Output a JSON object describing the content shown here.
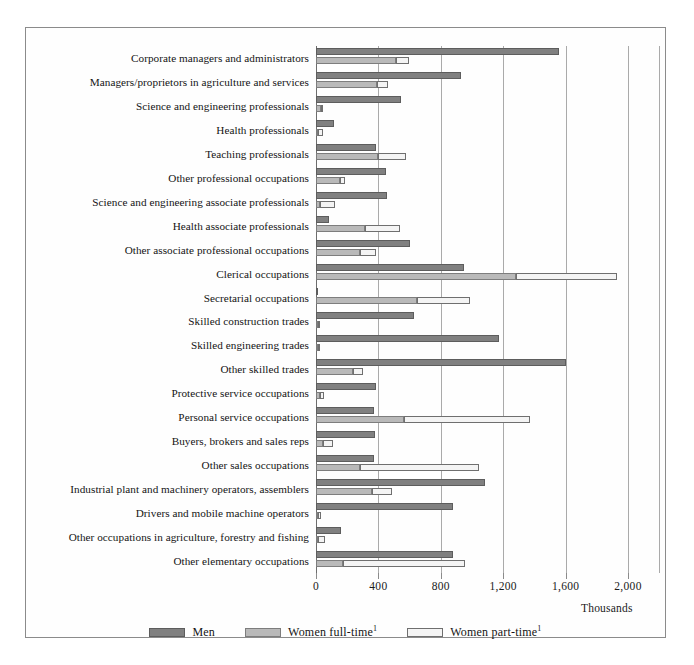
{
  "chart_data": {
    "type": "bar",
    "orientation": "horizontal",
    "style": "grouped-stacked",
    "title": "",
    "xlabel": "Thousands",
    "ylabel": "",
    "xlim": [
      0,
      2200
    ],
    "ticks": [
      0,
      400,
      800,
      1200,
      1600,
      2000
    ],
    "tick_labels": [
      "0",
      "400",
      "800",
      "1,200",
      "1,600",
      "2,000"
    ],
    "grid": "vertical",
    "legend_position": "bottom-center",
    "legend": [
      "Men",
      "Women full-time",
      "Women part-time"
    ],
    "legend_footnote_marker": "1",
    "series": [
      {
        "name": "Men",
        "color": "#808080",
        "values": [
          1560,
          930,
          545,
          115,
          385,
          450,
          455,
          85,
          605,
          950,
          15,
          625,
          1170,
          1605,
          385,
          370,
          380,
          370,
          1085,
          880,
          160,
          880
        ]
      },
      {
        "name": "Women full-time",
        "color": "#b9b9b9",
        "values": [
          515,
          390,
          30,
          15,
          400,
          155,
          25,
          315,
          285,
          1285,
          650,
          15,
          15,
          240,
          25,
          565,
          45,
          285,
          360,
          15,
          15,
          170
        ]
      },
      {
        "name": "Women part-time",
        "color": "#f4f4f4",
        "values": [
          80,
          70,
          15,
          30,
          180,
          30,
          100,
          225,
          100,
          645,
          340,
          10,
          10,
          60,
          25,
          810,
          65,
          760,
          125,
          15,
          45,
          785
        ]
      }
    ],
    "categories": [
      "Corporate managers and administrators",
      "Managers/proprietors in agriculture and services",
      "Science and engineering professionals",
      "Health professionals",
      "Teaching professionals",
      "Other professional occupations",
      "Science and engineering associate professionals",
      "Health associate professionals",
      "Other associate professional occupations",
      "Clerical occupations",
      "Secretarial occupations",
      "Skilled construction trades",
      "Skilled engineering trades",
      "Other skilled trades",
      "Protective service occupations",
      "Personal service occupations",
      "Buyers, brokers and sales reps",
      "Other sales occupations",
      "Industrial plant and machinery operators, assemblers",
      "Drivers and mobile machine operators",
      "Other occupations in agriculture, forestry and fishing",
      "Other elementary occupations"
    ]
  },
  "axis": {
    "units_label": "Thousands"
  },
  "legend": {
    "items": [
      {
        "label": "Men",
        "footnote": ""
      },
      {
        "label": "Women full-time",
        "footnote": "1"
      },
      {
        "label": "Women part-time",
        "footnote": "1"
      }
    ]
  }
}
